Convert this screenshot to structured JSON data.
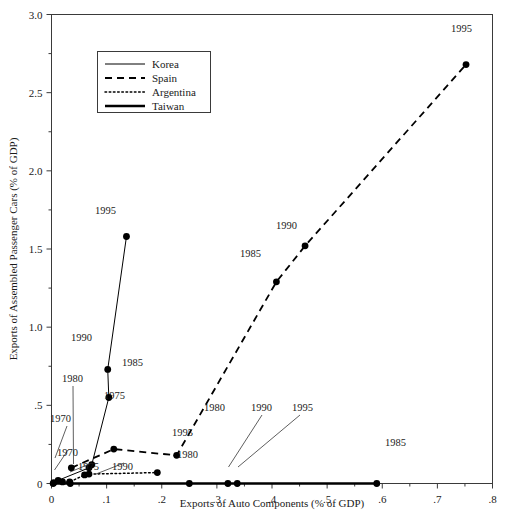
{
  "chart_data": {
    "type": "scatter",
    "title": "",
    "xlabel": "Exports of Auto Components (% of GDP)",
    "ylabel": "Exports of Assembled Passenger Cars (% of GDP)",
    "xlim": [
      0,
      0.8
    ],
    "ylim": [
      0,
      3.0
    ],
    "xticks": [
      0,
      0.1,
      0.2,
      0.3,
      0.4,
      0.5,
      0.6,
      0.7,
      0.8
    ],
    "xticklabels": [
      "0",
      ".1",
      ".2",
      ".3",
      ".4",
      ".5",
      ".6",
      ".7",
      ".8"
    ],
    "yticks": [
      0,
      0.5,
      1.0,
      1.5,
      2.0,
      2.5,
      3.0
    ],
    "yticklabels": [
      "0",
      ".5",
      "1.0",
      "1.5",
      "2.0",
      "2.5",
      "3.0"
    ],
    "yminorticks": [
      0.25,
      0.75,
      1.25,
      1.75,
      2.25,
      2.75
    ],
    "xminorticks": [
      0.05,
      0.15,
      0.25,
      0.35,
      0.45,
      0.55,
      0.65,
      0.75
    ],
    "grid": false,
    "legend_position": "upper-left-inside",
    "series": [
      {
        "name": "Korea",
        "style": "solid-thin",
        "points": [
          {
            "label": "1970",
            "x": 0.012,
            "y": 0.02
          },
          {
            "label": "1975",
            "x": 0.068,
            "y": 0.1
          },
          {
            "label": "1980",
            "x": 0.073,
            "y": 0.12
          },
          {
            "label": "1985",
            "x": 0.104,
            "y": 0.55
          },
          {
            "label": "1990",
            "x": 0.102,
            "y": 0.73
          },
          {
            "label": "1995",
            "x": 0.136,
            "y": 1.58
          }
        ]
      },
      {
        "name": "Spain",
        "style": "dashed",
        "points": [
          {
            "label": "1970",
            "x": 0.036,
            "y": 0.1
          },
          {
            "label": "1975",
            "x": 0.113,
            "y": 0.22
          },
          {
            "label": "1980",
            "x": 0.227,
            "y": 0.18
          },
          {
            "label": "1985",
            "x": 0.408,
            "y": 1.29
          },
          {
            "label": "1990",
            "x": 0.46,
            "y": 1.52
          },
          {
            "label": "1995",
            "x": 0.752,
            "y": 2.68
          }
        ]
      },
      {
        "name": "Argentina",
        "style": "dotted",
        "points": [
          {
            "label": "1970",
            "x": 0.004,
            "y": 0.005
          },
          {
            "label": "1975",
            "x": 0.033,
            "y": 0.01
          },
          {
            "label": "1980",
            "x": 0.02,
            "y": 0.01
          },
          {
            "label": "1985",
            "x": 0.06,
            "y": 0.055
          },
          {
            "label": "1990",
            "x": 0.068,
            "y": 0.06
          },
          {
            "label": "1995",
            "x": 0.192,
            "y": 0.07
          }
        ]
      },
      {
        "name": "Taiwan",
        "style": "solid-thick",
        "points": [
          {
            "label": "1970",
            "x": 0.003,
            "y": 0.0
          },
          {
            "label": "1975",
            "x": 0.034,
            "y": 0.0
          },
          {
            "label": "1980",
            "x": 0.25,
            "y": 0.0
          },
          {
            "label": "1985",
            "x": 0.59,
            "y": 0.0
          },
          {
            "label": "1990",
            "x": 0.32,
            "y": 0.0
          },
          {
            "label": "1995",
            "x": 0.337,
            "y": 0.0
          }
        ]
      }
    ],
    "annotations": [
      {
        "text": "1995",
        "series": "Korea",
        "x": 95,
        "y": 214
      },
      {
        "text": "1990",
        "series": "Korea",
        "x": 71,
        "y": 341
      },
      {
        "text": "1985",
        "series": "Korea",
        "x": 122,
        "y": 366
      },
      {
        "text": "1980",
        "series": "Korea",
        "x": 62,
        "y": 382
      },
      {
        "text": "1970",
        "series": "Korea",
        "x": 50,
        "y": 422
      },
      {
        "text": "1975",
        "series": "Spain",
        "x": 104,
        "y": 399
      },
      {
        "text": "1980",
        "series": "Spain",
        "x": 204,
        "y": 411
      },
      {
        "text": "1985",
        "series": "Spain",
        "x": 240,
        "y": 257
      },
      {
        "text": "1990",
        "series": "Spain",
        "x": 276,
        "y": 229
      },
      {
        "text": "1995",
        "series": "Spain",
        "x": 451,
        "y": 32
      },
      {
        "text": "1995",
        "series": "Argentina",
        "x": 172,
        "y": 436
      },
      {
        "text": "1970",
        "series": "Taiwan",
        "x": 57,
        "y": 456
      },
      {
        "text": "1975",
        "series": "Taiwan",
        "x": 78,
        "y": 470
      },
      {
        "text": "1990",
        "series": "Taiwan",
        "x": 112,
        "y": 470
      },
      {
        "text": "1980",
        "series": "Taiwan",
        "x": 177,
        "y": 458
      },
      {
        "text": "1990",
        "series": "Taiwan",
        "x": 251,
        "y": 411
      },
      {
        "text": "1995",
        "series": "Taiwan",
        "x": 292,
        "y": 411
      },
      {
        "text": "1985",
        "series": "Taiwan",
        "x": 385,
        "y": 446
      }
    ],
    "legend_entries": [
      {
        "label": "Korea",
        "style": "solid-thin"
      },
      {
        "label": "Spain",
        "style": "dashed"
      },
      {
        "label": "Argentina",
        "style": "dotted"
      },
      {
        "label": "Taiwan",
        "style": "solid-thick"
      }
    ]
  }
}
